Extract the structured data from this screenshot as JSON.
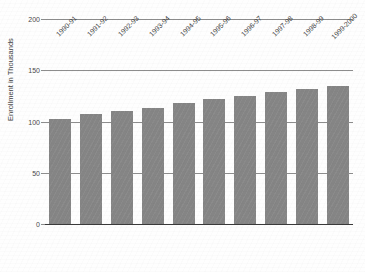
{
  "chart_data": {
    "type": "bar",
    "title": "",
    "xlabel": "",
    "ylabel": "Enrollment in Thousands",
    "ylim": [
      0,
      200
    ],
    "yticks": [
      0,
      50,
      100,
      150,
      200
    ],
    "grid": true,
    "legend": "none",
    "bar_color": "#858585",
    "categories": [
      "1990-91",
      "1991-92",
      "1992-93",
      "1993-94",
      "1994-95",
      "1995-96",
      "1996-97",
      "1997-98",
      "1998-99",
      "1999-2000"
    ],
    "values": [
      102,
      107,
      110,
      113,
      118,
      122,
      125,
      129,
      132,
      135
    ]
  },
  "axes": {
    "y_label": "Enrollment in Thousands",
    "y_tick_labels": [
      "0",
      "50",
      "100",
      "150",
      "200"
    ]
  }
}
